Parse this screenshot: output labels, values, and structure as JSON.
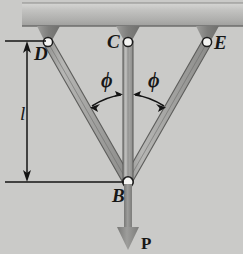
{
  "figure": {
    "kind": "statics-truss-free-body-diagram",
    "background_color": "#cacac8",
    "member_fill_color": "#a8a8a6",
    "member_edge_color": "#5b5b5b",
    "ceiling_color": "#b4b4b2",
    "pin_color": "#f2f2f0",
    "line_color": "#1a1a1a",
    "arrow_color": "#8d8d8b"
  },
  "labels": {
    "joint_d": "D",
    "joint_c": "C",
    "joint_e": "E",
    "joint_b": "B",
    "length": "l",
    "angle_left": "ϕ",
    "angle_right": "ϕ",
    "force": "P"
  },
  "geometry": {
    "pin_d": {
      "x": 48,
      "y": 42
    },
    "pin_c": {
      "x": 128,
      "y": 42
    },
    "pin_e": {
      "x": 207,
      "y": 42
    },
    "joint_b": {
      "x": 128,
      "y": 182
    },
    "ceiling": {
      "x": 22,
      "y": 4,
      "width": 221,
      "height": 22
    },
    "force_arrow": {
      "from_y": 182,
      "to_y": 250
    },
    "dimension_line": {
      "x": 27,
      "top_y": 41,
      "bottom_y": 182
    },
    "angle_value_note": "ϕ measured from vertical member CB to each inclined member"
  }
}
